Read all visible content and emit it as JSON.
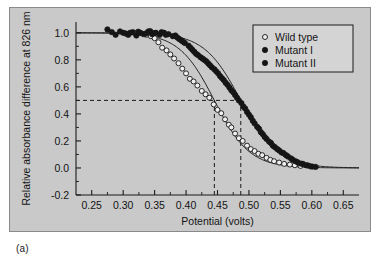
{
  "figure": {
    "panel_label": "(a)",
    "background_color": "#c9c9c9",
    "border_color": "#8a8a8a"
  },
  "chart_data": {
    "type": "scatter",
    "title": "",
    "xlabel": "Potential (volts)",
    "ylabel": "Relative absorbance difference at 826 nm",
    "xlim": [
      0.225,
      0.675
    ],
    "ylim": [
      -0.2,
      1.08
    ],
    "xticks": [
      0.25,
      0.3,
      0.35,
      0.4,
      0.45,
      0.5,
      0.55,
      0.6,
      0.65
    ],
    "xtick_labels": [
      "0.25",
      "0.30",
      "0.35",
      "0.40",
      "0.45",
      "0.50",
      "0.55",
      "0.60",
      "0.65"
    ],
    "yticks": [
      -0.2,
      0.0,
      0.2,
      0.4,
      0.6,
      0.8,
      1.0
    ],
    "ytick_labels": [
      "-0.2",
      "0.0",
      "0.2",
      "0.4",
      "0.6",
      "0.8",
      "1.0"
    ],
    "grid": false,
    "legend_position": "top-right",
    "legend": [
      {
        "label": "Wild type",
        "marker": "open-circle",
        "color": "#151515"
      },
      {
        "label": "Mutant I",
        "marker": "filled-circle",
        "color": "#151515"
      },
      {
        "label": "Mutant II",
        "marker": "filled-circle",
        "color": "#151515"
      }
    ],
    "annotations": [
      {
        "name": "midpoint-wild-type",
        "type": "vertical-dashed-line",
        "x": 0.445,
        "y_from": -0.2,
        "y_to": 0.5
      },
      {
        "name": "midpoint-mutant",
        "type": "vertical-dashed-line",
        "x": 0.487,
        "y_from": -0.2,
        "y_to": 0.5
      },
      {
        "name": "half-maximum",
        "type": "horizontal-dashed-line",
        "y": 0.5,
        "x_from": 0.225,
        "x_to": 0.487
      }
    ],
    "fits": [
      {
        "name": "wild-type-fit",
        "midpoint": 0.445,
        "slope": 0.028,
        "amplitude": 1.0,
        "baseline": 0.0
      },
      {
        "name": "mutant-fit",
        "midpoint": 0.487,
        "slope": 0.029,
        "amplitude": 1.0,
        "baseline": 0.0
      }
    ],
    "series": [
      {
        "name": "Wild type",
        "marker": "open-circle",
        "points": [
          [
            0.318,
            1.0
          ],
          [
            0.33,
            0.995
          ],
          [
            0.337,
            0.985
          ],
          [
            0.344,
            0.975
          ],
          [
            0.35,
            0.96
          ],
          [
            0.356,
            0.93
          ],
          [
            0.362,
            0.89
          ],
          [
            0.369,
            0.87
          ],
          [
            0.375,
            0.84
          ],
          [
            0.381,
            0.81
          ],
          [
            0.388,
            0.775
          ],
          [
            0.394,
            0.735
          ],
          [
            0.4,
            0.7
          ],
          [
            0.406,
            0.66
          ],
          [
            0.412,
            0.64
          ],
          [
            0.418,
            0.61
          ],
          [
            0.425,
            0.57
          ],
          [
            0.431,
            0.545
          ],
          [
            0.437,
            0.52
          ],
          [
            0.444,
            0.47
          ],
          [
            0.45,
            0.43
          ],
          [
            0.456,
            0.405
          ],
          [
            0.462,
            0.36
          ],
          [
            0.468,
            0.32
          ],
          [
            0.472,
            0.3
          ],
          [
            0.478,
            0.255
          ],
          [
            0.484,
            0.22
          ],
          [
            0.49,
            0.2
          ],
          [
            0.497,
            0.165
          ],
          [
            0.503,
            0.14
          ],
          [
            0.509,
            0.125
          ],
          [
            0.515,
            0.105
          ],
          [
            0.521,
            0.095
          ],
          [
            0.528,
            0.075
          ],
          [
            0.534,
            0.06
          ],
          [
            0.54,
            0.05
          ],
          [
            0.548,
            0.04
          ],
          [
            0.556,
            0.03
          ],
          [
            0.565,
            0.025
          ],
          [
            0.573,
            0.02
          ],
          [
            0.582,
            0.015
          ]
        ]
      },
      {
        "name": "Mutant I",
        "marker": "filled-circle",
        "points": [
          [
            0.275,
            1.025
          ],
          [
            0.288,
            0.985
          ],
          [
            0.3,
            1.0
          ],
          [
            0.308,
            0.985
          ],
          [
            0.315,
            1.005
          ],
          [
            0.321,
            0.98
          ],
          [
            0.327,
            1.0
          ],
          [
            0.333,
            0.99
          ],
          [
            0.34,
            1.01
          ],
          [
            0.346,
            0.99
          ],
          [
            0.352,
            1.0
          ],
          [
            0.358,
            0.985
          ],
          [
            0.365,
            1.0
          ],
          [
            0.372,
            0.99
          ],
          [
            0.379,
            0.975
          ],
          [
            0.386,
            0.965
          ],
          [
            0.392,
            0.945
          ],
          [
            0.398,
            0.925
          ],
          [
            0.404,
            0.905
          ],
          [
            0.41,
            0.875
          ],
          [
            0.416,
            0.845
          ],
          [
            0.423,
            0.82
          ],
          [
            0.429,
            0.8
          ],
          [
            0.435,
            0.775
          ],
          [
            0.441,
            0.745
          ],
          [
            0.448,
            0.715
          ],
          [
            0.454,
            0.68
          ],
          [
            0.46,
            0.65
          ],
          [
            0.466,
            0.615
          ],
          [
            0.472,
            0.575
          ],
          [
            0.478,
            0.54
          ],
          [
            0.484,
            0.5
          ],
          [
            0.491,
            0.455
          ],
          [
            0.497,
            0.415
          ],
          [
            0.503,
            0.375
          ],
          [
            0.509,
            0.33
          ],
          [
            0.516,
            0.29
          ],
          [
            0.522,
            0.25
          ],
          [
            0.528,
            0.215
          ],
          [
            0.535,
            0.185
          ],
          [
            0.541,
            0.155
          ],
          [
            0.548,
            0.13
          ],
          [
            0.555,
            0.11
          ],
          [
            0.562,
            0.085
          ],
          [
            0.57,
            0.06
          ],
          [
            0.578,
            0.04
          ],
          [
            0.586,
            0.03
          ],
          [
            0.594,
            0.018
          ],
          [
            0.601,
            0.01
          ]
        ]
      },
      {
        "name": "Mutant II",
        "marker": "filled-circle",
        "points": [
          [
            0.282,
            1.005
          ],
          [
            0.295,
            1.01
          ],
          [
            0.304,
            0.995
          ],
          [
            0.311,
            1.0
          ],
          [
            0.324,
            1.008
          ],
          [
            0.336,
            0.995
          ],
          [
            0.343,
            1.012
          ],
          [
            0.349,
            0.998
          ],
          [
            0.361,
            1.005
          ],
          [
            0.368,
            0.985
          ],
          [
            0.383,
            0.98
          ],
          [
            0.389,
            0.955
          ],
          [
            0.395,
            0.935
          ],
          [
            0.407,
            0.89
          ],
          [
            0.413,
            0.86
          ],
          [
            0.419,
            0.835
          ],
          [
            0.426,
            0.81
          ],
          [
            0.432,
            0.79
          ],
          [
            0.438,
            0.76
          ],
          [
            0.445,
            0.73
          ],
          [
            0.451,
            0.7
          ],
          [
            0.457,
            0.665
          ],
          [
            0.463,
            0.63
          ],
          [
            0.469,
            0.595
          ],
          [
            0.475,
            0.56
          ],
          [
            0.481,
            0.52
          ],
          [
            0.488,
            0.48
          ],
          [
            0.494,
            0.44
          ],
          [
            0.5,
            0.395
          ],
          [
            0.506,
            0.35
          ],
          [
            0.513,
            0.305
          ],
          [
            0.519,
            0.265
          ],
          [
            0.525,
            0.23
          ],
          [
            0.532,
            0.195
          ],
          [
            0.538,
            0.165
          ],
          [
            0.545,
            0.14
          ],
          [
            0.552,
            0.115
          ],
          [
            0.559,
            0.095
          ],
          [
            0.567,
            0.07
          ],
          [
            0.575,
            0.048
          ],
          [
            0.583,
            0.032
          ],
          [
            0.591,
            0.02
          ],
          [
            0.598,
            0.012
          ],
          [
            0.606,
            0.008
          ]
        ]
      }
    ]
  }
}
